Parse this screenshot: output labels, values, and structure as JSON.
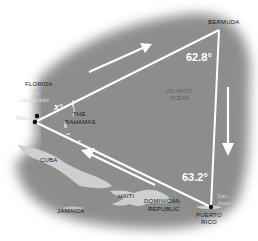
{
  "map": {
    "title": "Bermuda Triangle",
    "colors": {
      "sea": "#8c8c8c",
      "land": "#cfcfcf",
      "lines": "#ffffff",
      "vertex": "#111111",
      "background": "#ffffff"
    },
    "vertices": [
      {
        "name": "Miami",
        "x": 35,
        "y": 122
      },
      {
        "name": "Bermuda",
        "x": 219,
        "y": 30
      },
      {
        "name": "Puerto Rico",
        "x": 211,
        "y": 207
      }
    ],
    "labels": {
      "florida": "FLORIDA",
      "ft": "Ft.",
      "lauderdale": "Lauderdale",
      "miami": "Miami",
      "bahamas_1": "THE",
      "bahamas_2": "BAHAMAS",
      "bermuda": "BERMUDA",
      "atlantic_1": "ATLANTIC",
      "atlantic_2": "OCEAN",
      "cuba": "CUBA",
      "haiti": "HAITI",
      "dominican_1": "DOMINICAN",
      "dominican_2": "REPUBLIC",
      "jamaica": "JAMAICA",
      "san": "San",
      "juan": "Juan",
      "puerto_1": "PUERTO",
      "puerto_2": "RICO"
    },
    "angles": {
      "bermuda": "62.8°",
      "puerto_rico": "63.2°",
      "miami": "x°"
    },
    "arrows": [
      {
        "direction": "toward-bermuda",
        "from": [
          89,
          72
        ],
        "to": [
          148,
          46
        ]
      },
      {
        "direction": "toward-puerto-rico",
        "from": [
          228,
          87
        ],
        "to": [
          228,
          155
        ]
      },
      {
        "direction": "toward-miami",
        "from": [
          155,
          185
        ],
        "to": [
          83,
          151
        ]
      }
    ]
  }
}
